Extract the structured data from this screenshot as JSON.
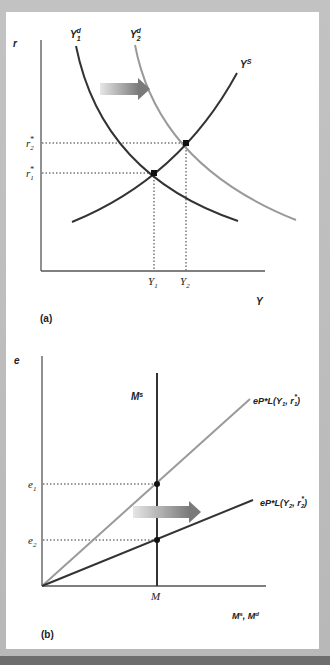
{
  "colors": {
    "frame": "#bdbdbd",
    "panel": "#ffffff",
    "axis": "#555555",
    "dark_curve": "#333333",
    "light_curve": "#999999",
    "arrow_start": "#e2e2e2",
    "arrow_end": "#7a7a7a"
  },
  "panel_a": {
    "label": "(a)",
    "y_axis_label": "r",
    "x_axis_label": "Y",
    "curves": {
      "y1d": {
        "name": "Y",
        "sub": "1",
        "sup": "d"
      },
      "y2d": {
        "name": "Y",
        "sub": "2",
        "sup": "d"
      },
      "ys": {
        "name": "Y",
        "sup": "S"
      }
    },
    "ticks_y": [
      {
        "name": "r",
        "sub": "2",
        "sup": "*"
      },
      {
        "name": "r",
        "sub": "1",
        "sup": "*"
      }
    ],
    "ticks_x": [
      {
        "name": "Y",
        "sub": "1"
      },
      {
        "name": "Y",
        "sub": "2"
      }
    ],
    "arrow": "shift-right"
  },
  "panel_b": {
    "label": "(b)",
    "y_axis_label": "e",
    "x_axis_label": "M",
    "x_axis_label_sup1": "s",
    "x_axis_label_sep": ", M",
    "x_axis_label_sup2": "d",
    "ms_label": "M",
    "ms_sup": "s",
    "line1": {
      "prefix": "eP*L(Y",
      "sub1": "1",
      "mid": ", r",
      "sub2": "1",
      "sup": "*",
      "suffix": ")"
    },
    "line2": {
      "prefix": "eP*L(Y",
      "sub1": "2",
      "mid": ", r",
      "sub2": "2",
      "sup": "*",
      "suffix": ")"
    },
    "ticks_y": [
      {
        "name": "e",
        "sub": "1"
      },
      {
        "name": "e",
        "sub": "2"
      }
    ],
    "tick_x": {
      "name": "M"
    },
    "arrow": "shift-right"
  }
}
